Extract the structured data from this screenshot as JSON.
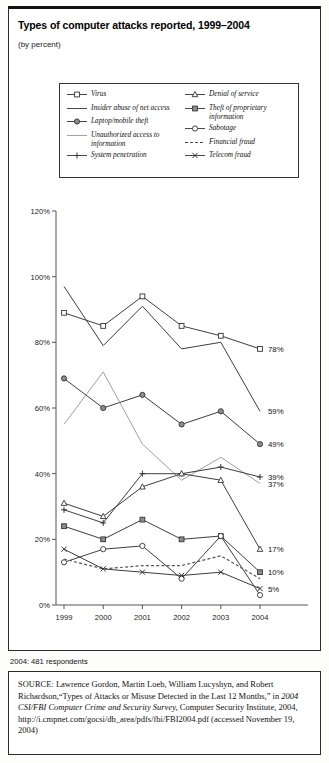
{
  "header": {
    "title": "Types of computer attacks reported, 1999–2004",
    "subtitle": "(by percent)"
  },
  "legend": {
    "left": [
      {
        "label": "Virus",
        "marker": "open-square",
        "line": "solid"
      },
      {
        "label": "Insider abuse of net access",
        "marker": "none",
        "line": "solid"
      },
      {
        "label": "Laptop/mobile theft",
        "marker": "filled-circle",
        "line": "solid"
      },
      {
        "label": "Unauthorized access to information",
        "marker": "none",
        "line": "solid-gray"
      },
      {
        "label": "System penetration",
        "marker": "plus",
        "line": "solid"
      }
    ],
    "right": [
      {
        "label": "Denial of service",
        "marker": "open-triangle",
        "line": "solid"
      },
      {
        "label": "Theft of proprietary information",
        "marker": "filled-square",
        "line": "solid"
      },
      {
        "label": "Sabotage",
        "marker": "open-circle",
        "line": "solid"
      },
      {
        "label": "Financial fraud",
        "marker": "none",
        "line": "dashed"
      },
      {
        "label": "Telecom fraud",
        "marker": "x",
        "line": "solid"
      }
    ]
  },
  "footnote": {
    "respondents": "2004: 481 respondents",
    "source_label": "SOURCE:",
    "source_part1": " Lawrence Gordon, Martin Loeb, William Lucyshyn, and Robert Richardson,“Types of Attacks or Misuse Detected in the Last 12 Months,” in ",
    "source_italic1": "2004 CSI/FBI Computer Crime and Security Survey,",
    "source_part2": " Computer Security Institute, 2004, http://i.cmpnet.com/gocsi/db_area/pdfs/fbi/FBI2004.pdf (accessed November 19, 2004)"
  },
  "chart_data": {
    "type": "line",
    "title": "Types of computer attacks reported, 1999–2004",
    "subtitle": "(by percent)",
    "xlabel": "",
    "ylabel": "",
    "categories": [
      "1999",
      "2000",
      "2001",
      "2002",
      "2003",
      "2004"
    ],
    "x": [
      1999,
      2000,
      2001,
      2002,
      2003,
      2004
    ],
    "ylim": [
      0,
      120
    ],
    "yticks": [
      0,
      20,
      40,
      60,
      80,
      100,
      120
    ],
    "ytick_labels": [
      "0%",
      "20%",
      "40%",
      "60%",
      "80%",
      "100%",
      "120%"
    ],
    "grid": false,
    "legend_position": "top",
    "series": [
      {
        "name": "Virus",
        "marker": "open-square",
        "line": "solid",
        "color": "#333333",
        "values": [
          89,
          85,
          94,
          85,
          82,
          78
        ],
        "end_label": "78%"
      },
      {
        "name": "Insider abuse of net access",
        "marker": "none",
        "line": "solid",
        "color": "#333333",
        "values": [
          97,
          79,
          91,
          78,
          80,
          59
        ],
        "end_label": "59%"
      },
      {
        "name": "Laptop/mobile theft",
        "marker": "filled-circle",
        "line": "solid",
        "color": "#333333",
        "values": [
          69,
          60,
          64,
          55,
          59,
          49
        ],
        "end_label": "49%"
      },
      {
        "name": "Unauthorized access to information",
        "marker": "none",
        "line": "solid-gray",
        "color": "#9a9a9a",
        "values": [
          55,
          71,
          49,
          38,
          45,
          37
        ],
        "end_label": "37%"
      },
      {
        "name": "System penetration",
        "marker": "plus",
        "line": "solid",
        "color": "#333333",
        "values": [
          29,
          25,
          40,
          40,
          42,
          39
        ],
        "end_label": "39%"
      },
      {
        "name": "Denial of service",
        "marker": "open-triangle",
        "line": "solid",
        "color": "#333333",
        "values": [
          31,
          27,
          36,
          40,
          38,
          17
        ],
        "end_label": "17%"
      },
      {
        "name": "Theft of proprietary information",
        "marker": "filled-square",
        "line": "solid",
        "color": "#333333",
        "values": [
          24,
          20,
          26,
          20,
          21,
          10
        ],
        "end_label": "10%"
      },
      {
        "name": "Sabotage",
        "marker": "open-circle",
        "line": "solid",
        "color": "#333333",
        "values": [
          13,
          17,
          18,
          8,
          21,
          3
        ],
        "end_label": ""
      },
      {
        "name": "Financial fraud",
        "marker": "none",
        "line": "dashed",
        "color": "#555555",
        "values": [
          14,
          11,
          12,
          12,
          15,
          8
        ],
        "end_label": ""
      },
      {
        "name": "Telecom fraud",
        "marker": "x",
        "line": "solid",
        "color": "#333333",
        "values": [
          17,
          11,
          10,
          9,
          10,
          5
        ],
        "end_label": "5%"
      }
    ],
    "end_labels": [
      "78%",
      "59%",
      "49%",
      "39%",
      "37%",
      "17%",
      "10%",
      "5%"
    ]
  }
}
